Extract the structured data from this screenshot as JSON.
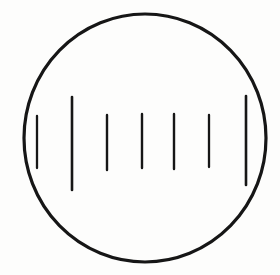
{
  "canvas": {
    "width": 280,
    "height": 275,
    "background": "#fdfdfc"
  },
  "diagram": {
    "name": "eyepiece-reticle-scale",
    "ink_color": "#161616",
    "field_circle": {
      "cx": 145,
      "cy": 138,
      "rx": 121,
      "ry": 124,
      "stroke_width": 3.2,
      "fill": "none"
    },
    "scale_ticks": [
      {
        "x": 37,
        "y1": 116,
        "y2": 168,
        "stroke_width": 2.3,
        "kind": "minor"
      },
      {
        "x": 72,
        "y1": 97,
        "y2": 190,
        "stroke_width": 2.6,
        "kind": "major"
      },
      {
        "x": 107,
        "y1": 115,
        "y2": 170,
        "stroke_width": 2.4,
        "kind": "minor"
      },
      {
        "x": 142,
        "y1": 114,
        "y2": 168,
        "stroke_width": 2.4,
        "kind": "minor"
      },
      {
        "x": 174,
        "y1": 114,
        "y2": 169,
        "stroke_width": 2.4,
        "kind": "minor"
      },
      {
        "x": 209,
        "y1": 115,
        "y2": 167,
        "stroke_width": 2.3,
        "kind": "minor"
      },
      {
        "x": 246,
        "y1": 96,
        "y2": 185,
        "stroke_width": 2.6,
        "kind": "major"
      }
    ]
  }
}
